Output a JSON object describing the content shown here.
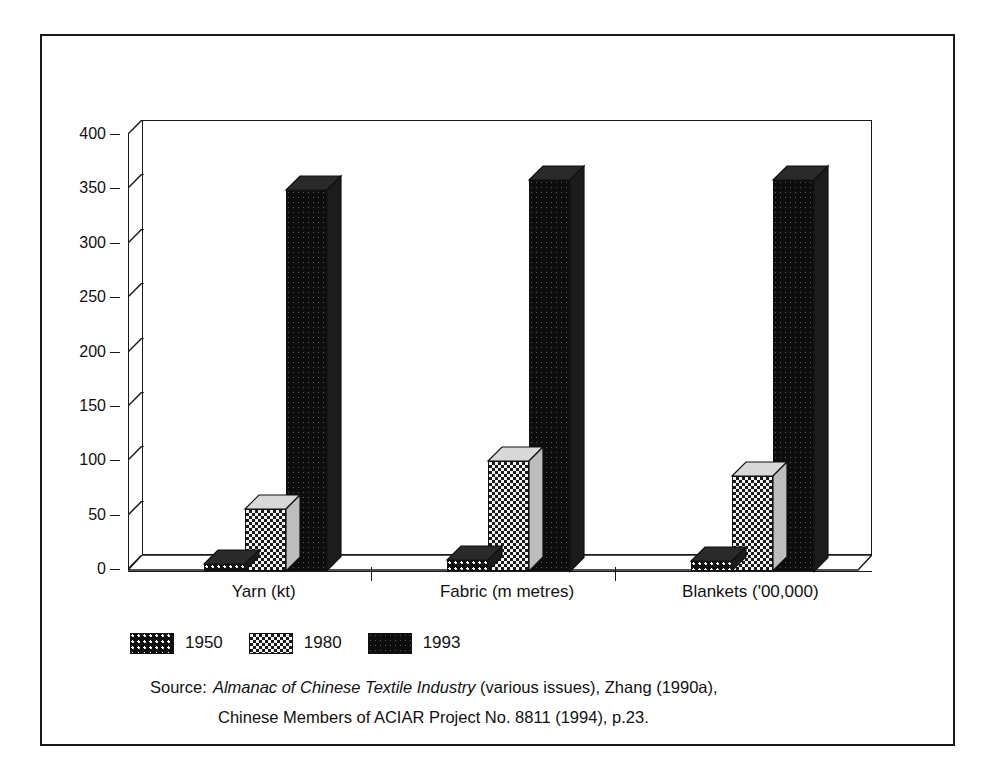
{
  "chart_data": {
    "type": "bar",
    "title": "",
    "subtitle": "",
    "xlabel": "",
    "ylabel": "",
    "ylim": [
      0,
      400
    ],
    "ytick_step": 50,
    "yticks": [
      "400",
      "350",
      "300",
      "250",
      "200",
      "150",
      "100",
      "50",
      "0"
    ],
    "grid": false,
    "legend_position": "bottom-left",
    "three_d": true,
    "categories": [
      "Yarn (kt)",
      "Fabric (m metres)",
      "Blankets ('00,000)"
    ],
    "series": [
      {
        "name": "1950",
        "values": [
          6,
          10,
          9
        ],
        "pattern": "dark-dotted"
      },
      {
        "name": "1980",
        "values": [
          57,
          101,
          87
        ],
        "pattern": "light-checker"
      },
      {
        "name": "1993",
        "values": [
          350,
          360,
          360
        ],
        "pattern": "solid-dark"
      }
    ]
  },
  "legend": {
    "items": [
      {
        "label": "1950",
        "swatch": "swatch-1950"
      },
      {
        "label": "1980",
        "swatch": "swatch-1980"
      },
      {
        "label": "1993",
        "swatch": "swatch-1993"
      }
    ]
  },
  "source": {
    "label": "Source:",
    "italic_title": "Almanac of Chinese Textile Industry",
    "line1_rest": "(various issues), Zhang (1990a),",
    "line2": "Chinese Members of ACIAR Project No. 8811 (1994), p.23."
  },
  "colors": {
    "ink": "#1a1a1a",
    "paper": "#ffffff",
    "dark_fill": "#101010",
    "light_fill": "#f2f2f2"
  }
}
